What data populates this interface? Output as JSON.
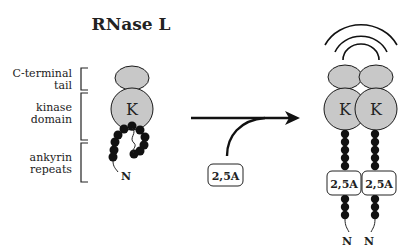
{
  "title": "RNase L",
  "labels": {
    "c_terminal_line1": "C-terminal",
    "c_terminal_line2": "tail",
    "kinase_line1": "kinase",
    "kinase_line2": "domain",
    "ankyrin_line1": "ankyrin",
    "ankyrin_line2": "repeats"
  },
  "monomer": {
    "kinase_letter": "K",
    "n_terminus": "N"
  },
  "activator": {
    "label": "2,5A"
  },
  "dimer": {
    "left": {
      "kinase_letter": "K",
      "ligand": "2,5A",
      "n_terminus": "N"
    },
    "right": {
      "kinase_letter": "K",
      "ligand": "2,5A",
      "n_terminus": "N"
    }
  },
  "colors": {
    "domain_fill": "#c8c8c8",
    "stroke": "#1a1a1a",
    "bead": "#111111",
    "background": "#ffffff"
  }
}
